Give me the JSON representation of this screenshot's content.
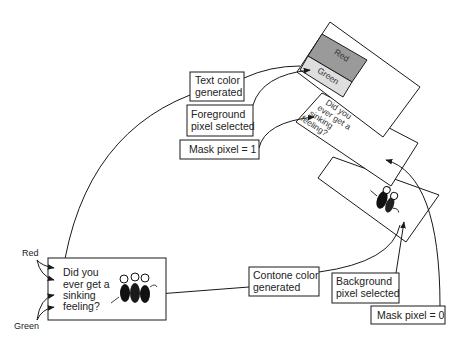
{
  "colors": {
    "stroke": "#1a1a1a",
    "text": "#222222",
    "red_swatch": "#9a9a9a",
    "green_swatch": "#dedede",
    "background": "#ffffff"
  },
  "labels": {
    "text_color": {
      "line1": "Text color",
      "line2": "generated"
    },
    "foreground": {
      "line1": "Foreground",
      "line2": "pixel selected"
    },
    "mask1": {
      "line1": "Mask pixel = 1"
    },
    "contone": {
      "line1": "Contone color",
      "line2": "generated"
    },
    "background": {
      "line1": "Background",
      "line2": "pixel selected"
    },
    "mask0": {
      "line1": "Mask pixel = 0"
    }
  },
  "result": {
    "lines": [
      "Did you",
      "ever get a",
      "sinking",
      "feeling?"
    ],
    "input_labels": {
      "top": "Red",
      "bottom": "Green"
    }
  },
  "planes": {
    "foreground": {
      "swatch_top": "Red",
      "swatch_bottom": "Green"
    },
    "mask": {
      "lines": [
        "Did you",
        "ever get a",
        "sinking",
        "feeling?"
      ]
    },
    "background": {
      "content": "cartoon-figures"
    }
  }
}
